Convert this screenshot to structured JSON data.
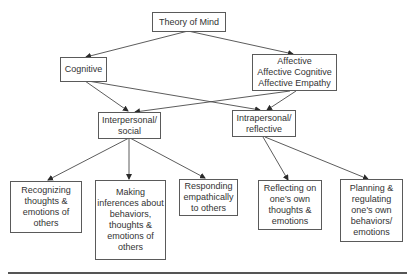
{
  "diagram": {
    "type": "hierarchy",
    "nodes": {
      "root": {
        "label": "Theory of Mind"
      },
      "cognitive": {
        "label": "Cognitive"
      },
      "affective": {
        "label": "Affective\nAffective Cognitive\nAffective Empathy"
      },
      "interpersonal": {
        "label": "Interpersonal/\nsocial"
      },
      "intrapersonal": {
        "label": "Intrapersonal/\nreflective"
      },
      "recognizing": {
        "label": "Recognizing\nthoughts &\nemotions of\nothers"
      },
      "inferences": {
        "label": "Making\ninferences about\nbehaviors,\nthoughts &\nemotions of\nothers"
      },
      "responding": {
        "label": "Responding\nempathically\nto others"
      },
      "reflecting": {
        "label": "Reflecting on\none's own\nthoughts &\nemotions"
      },
      "planning": {
        "label": "Planning &\nregulating\none's own\nbehaviors/\nemotions"
      }
    },
    "edges": [
      {
        "from": "root",
        "to": "cognitive"
      },
      {
        "from": "root",
        "to": "affective"
      },
      {
        "from": "cognitive",
        "to": "interpersonal"
      },
      {
        "from": "cognitive",
        "to": "intrapersonal"
      },
      {
        "from": "affective",
        "to": "interpersonal"
      },
      {
        "from": "affective",
        "to": "intrapersonal"
      },
      {
        "from": "interpersonal",
        "to": "recognizing"
      },
      {
        "from": "interpersonal",
        "to": "inferences"
      },
      {
        "from": "interpersonal",
        "to": "responding"
      },
      {
        "from": "intrapersonal",
        "to": "reflecting"
      },
      {
        "from": "intrapersonal",
        "to": "planning"
      }
    ],
    "colors": {
      "line": "#4a4a4a",
      "border": "#5a5a5a",
      "text": "#333333",
      "background": "#ffffff"
    }
  }
}
